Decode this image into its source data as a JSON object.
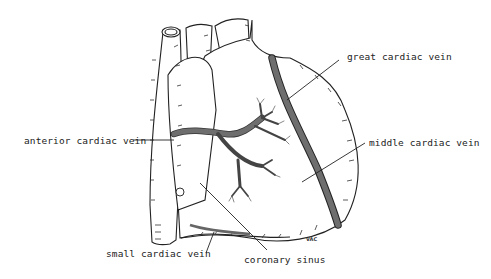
{
  "diagram": {
    "colors": {
      "vein_fill": "#6e6e6e",
      "outline": "#222222",
      "artery_shadow": "#dddddd",
      "background": "#ffffff"
    },
    "labels": {
      "great_cardiac_vein": "great cardiac vein",
      "anterior_cardiac_vein": "anterior cardiac vein",
      "middle_cardiac_vein": "middle cardiac vein",
      "small_cardiac_vein": "small cardiac vein",
      "coronary_sinus": "coronary sinus"
    },
    "signature": "VAC"
  }
}
